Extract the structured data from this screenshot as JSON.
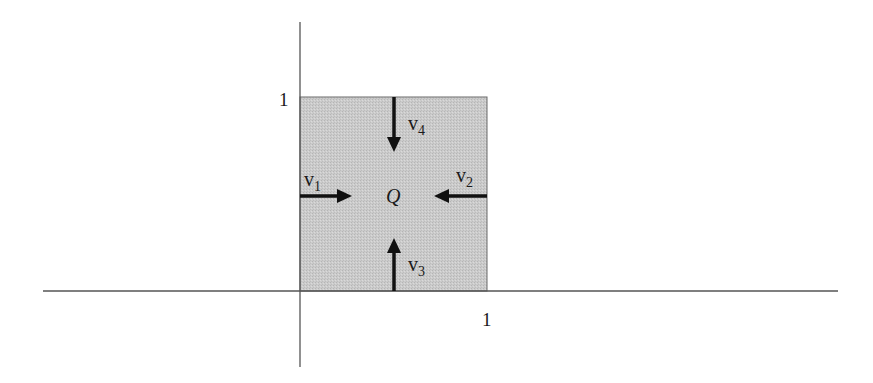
{
  "figure": {
    "region_label": "Q",
    "axis_labels": {
      "x_tick": "1",
      "y_tick": "1"
    },
    "arrows": [
      {
        "name": "v1",
        "base": "v",
        "sub": "1",
        "direction": "right",
        "side": "left"
      },
      {
        "name": "v2",
        "base": "v",
        "sub": "2",
        "direction": "left",
        "side": "right"
      },
      {
        "name": "v3",
        "base": "v",
        "sub": "3",
        "direction": "up",
        "side": "bottom"
      },
      {
        "name": "v4",
        "base": "v",
        "sub": "4",
        "direction": "down",
        "side": "top"
      }
    ],
    "colors": {
      "square_fill": "#c8c8c8",
      "axis": "#555555",
      "arrow": "#111111"
    }
  }
}
